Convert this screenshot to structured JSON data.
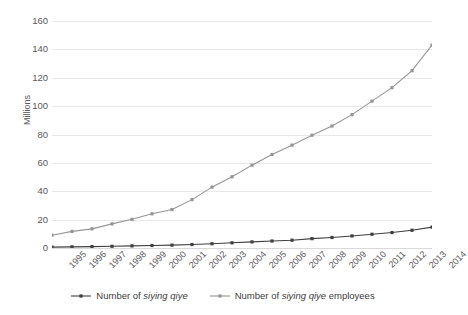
{
  "chart_data": {
    "type": "line",
    "title": "",
    "xlabel": "",
    "ylabel": "Millions",
    "ylim": [
      0,
      160
    ],
    "yticks": [
      0,
      20,
      40,
      60,
      80,
      100,
      120,
      140,
      160
    ],
    "grid": true,
    "legend_position": "bottom",
    "categories": [
      "1995",
      "1996",
      "1997",
      "1998",
      "1999",
      "2000",
      "2001",
      "2002",
      "2003",
      "2004",
      "2005",
      "2006",
      "2007",
      "2008",
      "2009",
      "2010",
      "2011",
      "2012",
      "2013",
      "2014"
    ],
    "series": [
      {
        "name": "Number of siying qiye",
        "name_italic_part": "siying qiye",
        "color": "#404040",
        "marker": "square",
        "values": [
          0.65,
          0.82,
          0.96,
          1.2,
          1.5,
          1.76,
          2.03,
          2.44,
          3.0,
          3.65,
          4.3,
          4.95,
          5.5,
          6.6,
          7.4,
          8.5,
          9.7,
          10.9,
          12.5,
          14.7
        ]
      },
      {
        "name": "Number of siying qiye employees",
        "name_italic_part": "siying qiye",
        "color": "#969696",
        "marker": "square",
        "values": [
          9.0,
          11.7,
          13.5,
          17.0,
          20.2,
          24.1,
          27.1,
          34.1,
          42.9,
          50.2,
          58.4,
          65.9,
          72.5,
          79.5,
          86.0,
          94.0,
          103.5,
          113.0,
          125.0,
          143.0
        ]
      }
    ]
  },
  "legend": {
    "items": [
      {
        "prefix": "Number of ",
        "italic": "siying qiye",
        "suffix": ""
      },
      {
        "prefix": "Number of ",
        "italic": "siying qiye",
        "suffix": " employees"
      }
    ]
  }
}
